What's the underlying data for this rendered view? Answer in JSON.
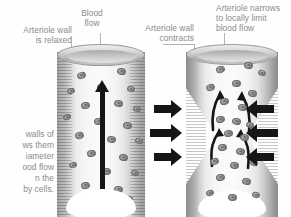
{
  "figure": {
    "type": "anatomical-diagram",
    "palette": {
      "background": "#ffffff",
      "label_text": "#8b8b8b",
      "leader_line": "#b4b4b4",
      "arrow": "#161616",
      "vessel_wall": "#8d8d8d",
      "lumen": "#fafafa",
      "nucleus": "#6f6f6f"
    }
  },
  "labels": {
    "arteriole_relaxed": "Arteriole wall\nis relaxed",
    "blood_flow": "Blood\nflow",
    "arteriole_contracts": "Arteriole wall\ncontracts",
    "arteriole_narrows": "Arteriole narrows\nto locally limit\nblood flow",
    "body_text": "walls of\nws them\niameter\nood flow\nn the\nby cells."
  },
  "panels": [
    {
      "id": "relaxed",
      "title": "Arteriole wall is relaxed",
      "state": "dilated",
      "flow_direction": "upward",
      "flow_arrows": 1
    },
    {
      "id": "constricted",
      "title": "Arteriole narrows to locally limit blood flow",
      "state": "constricted",
      "flow_direction": "upward",
      "flow_arrows": 4,
      "pressure_arrow_pairs": 3
    }
  ],
  "nuclei": {
    "left": [
      {
        "x": 20,
        "y": 28,
        "w": 9,
        "h": 7,
        "r": -18
      },
      {
        "x": 60,
        "y": 24,
        "w": 9,
        "h": 7,
        "r": 12
      },
      {
        "x": 10,
        "y": 44,
        "w": 8,
        "h": 6,
        "r": -22
      },
      {
        "x": 40,
        "y": 40,
        "w": 9,
        "h": 7,
        "r": 5
      },
      {
        "x": 70,
        "y": 42,
        "w": 8,
        "h": 6,
        "r": 16
      },
      {
        "x": 24,
        "y": 58,
        "w": 9,
        "h": 7,
        "r": -10
      },
      {
        "x": 57,
        "y": 56,
        "w": 9,
        "h": 7,
        "r": 8
      },
      {
        "x": 6,
        "y": 70,
        "w": 8,
        "h": 6,
        "r": -25
      },
      {
        "x": 76,
        "y": 62,
        "w": 8,
        "h": 6,
        "r": 20
      },
      {
        "x": 37,
        "y": 74,
        "w": 9,
        "h": 7,
        "r": -4
      },
      {
        "x": 66,
        "y": 78,
        "w": 9,
        "h": 7,
        "r": 10
      },
      {
        "x": 18,
        "y": 88,
        "w": 9,
        "h": 7,
        "r": -14
      },
      {
        "x": 50,
        "y": 92,
        "w": 9,
        "h": 7,
        "r": 6
      },
      {
        "x": 78,
        "y": 94,
        "w": 8,
        "h": 6,
        "r": 18
      },
      {
        "x": 30,
        "y": 106,
        "w": 9,
        "h": 7,
        "r": -8
      },
      {
        "x": 62,
        "y": 110,
        "w": 9,
        "h": 7,
        "r": 9
      },
      {
        "x": 12,
        "y": 118,
        "w": 8,
        "h": 6,
        "r": -20
      },
      {
        "x": 45,
        "y": 124,
        "w": 9,
        "h": 7,
        "r": 3
      },
      {
        "x": 74,
        "y": 126,
        "w": 8,
        "h": 6,
        "r": 15
      },
      {
        "x": 24,
        "y": 138,
        "w": 9,
        "h": 7,
        "r": -12
      },
      {
        "x": 57,
        "y": 142,
        "w": 9,
        "h": 7,
        "r": 7
      },
      {
        "x": 36,
        "y": 154,
        "w": 9,
        "h": 7,
        "r": -6
      },
      {
        "x": 68,
        "y": 152,
        "w": 8,
        "h": 6,
        "r": 14
      }
    ],
    "right": [
      {
        "x": 30,
        "y": 22,
        "w": 9,
        "h": 7,
        "r": -15
      },
      {
        "x": 58,
        "y": 18,
        "w": 9,
        "h": 7,
        "r": 10
      },
      {
        "x": 72,
        "y": 26,
        "w": 8,
        "h": 6,
        "r": 18
      },
      {
        "x": 20,
        "y": 40,
        "w": 9,
        "h": 7,
        "r": -20
      },
      {
        "x": 46,
        "y": 36,
        "w": 9,
        "h": 7,
        "r": 4
      },
      {
        "x": 62,
        "y": 46,
        "w": 9,
        "h": 7,
        "r": 12
      },
      {
        "x": 34,
        "y": 54,
        "w": 9,
        "h": 7,
        "r": -8
      },
      {
        "x": 52,
        "y": 60,
        "w": 9,
        "h": 7,
        "r": 6
      },
      {
        "x": 30,
        "y": 72,
        "w": 9,
        "h": 7,
        "r": -12
      },
      {
        "x": 46,
        "y": 74,
        "w": 9,
        "h": 7,
        "r": 8
      },
      {
        "x": 60,
        "y": 78,
        "w": 8,
        "h": 6,
        "r": 16
      },
      {
        "x": 38,
        "y": 86,
        "w": 9,
        "h": 7,
        "r": -5
      },
      {
        "x": 54,
        "y": 90,
        "w": 9,
        "h": 7,
        "r": 9
      },
      {
        "x": 32,
        "y": 100,
        "w": 9,
        "h": 7,
        "r": -10
      },
      {
        "x": 50,
        "y": 104,
        "w": 9,
        "h": 7,
        "r": 5
      },
      {
        "x": 24,
        "y": 114,
        "w": 9,
        "h": 7,
        "r": -18
      },
      {
        "x": 44,
        "y": 118,
        "w": 9,
        "h": 7,
        "r": 7
      },
      {
        "x": 64,
        "y": 116,
        "w": 8,
        "h": 6,
        "r": 14
      },
      {
        "x": 30,
        "y": 130,
        "w": 9,
        "h": 7,
        "r": -9
      },
      {
        "x": 56,
        "y": 134,
        "w": 9,
        "h": 7,
        "r": 8
      },
      {
        "x": 20,
        "y": 146,
        "w": 8,
        "h": 6,
        "r": -22
      },
      {
        "x": 42,
        "y": 150,
        "w": 9,
        "h": 7,
        "r": 3
      },
      {
        "x": 66,
        "y": 148,
        "w": 8,
        "h": 6,
        "r": 16
      }
    ]
  }
}
